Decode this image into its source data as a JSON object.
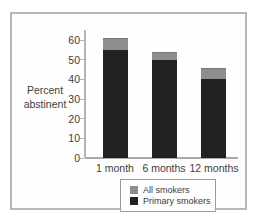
{
  "chart_data": {
    "type": "bar",
    "title": "",
    "xlabel": "",
    "ylabel": "Percent\nabstinent",
    "categories": [
      "1 month",
      "6 months",
      "12 months"
    ],
    "series": [
      {
        "name": "All smokers",
        "values": [
          61,
          54,
          46
        ],
        "color": "#8d8d8d"
      },
      {
        "name": "Primary smokers",
        "values": [
          55,
          50,
          40
        ],
        "color": "#222222"
      }
    ],
    "ylim": [
      0,
      60
    ],
    "yticks": [
      0,
      10,
      20,
      30,
      40,
      50,
      60
    ],
    "grid": false,
    "legend_position": "bottom",
    "bar_style": "overlaid (primary-smokers bar drawn in front of all-smokers bar)"
  },
  "legend": {
    "items": [
      {
        "label": "All smokers",
        "color": "#8d8d8d"
      },
      {
        "label": "Primary smokers",
        "color": "#222222"
      }
    ]
  }
}
